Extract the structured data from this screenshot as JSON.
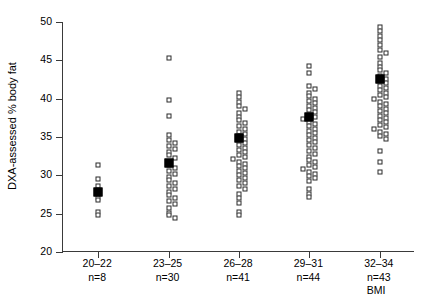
{
  "chart_data": {
    "type": "scatter",
    "title": "",
    "xlabel": "BMI",
    "ylabel": "DXA-assessed % body fat",
    "ylim": [
      20,
      50
    ],
    "yticks": [
      20,
      25,
      30,
      35,
      40,
      45,
      50
    ],
    "grid": false,
    "legend": null,
    "categories": [
      "20–22",
      "23–25",
      "26–28",
      "29–31",
      "32–34"
    ],
    "counts": [
      "n=8",
      "n=30",
      "n=41",
      "n=44",
      "n=43"
    ],
    "n_values": [
      8,
      30,
      41,
      44,
      43
    ],
    "means": [
      27.8,
      31.6,
      34.9,
      37.6,
      42.6
    ],
    "groups": [
      {
        "category": "20–22",
        "count_label": "n=8",
        "mean": 27.8,
        "values": [
          31.4,
          29.5,
          28.6,
          27.9,
          27.1,
          26.8,
          25.2,
          24.8
        ]
      },
      {
        "category": "23–25",
        "count_label": "n=30",
        "mean": 31.6,
        "values": [
          45.3,
          39.8,
          37.8,
          35.2,
          34.6,
          34.2,
          33.8,
          33.4,
          33.0,
          32.6,
          32.2,
          31.8,
          31.4,
          31.0,
          30.6,
          30.2,
          29.8,
          29.4,
          29.0,
          28.6,
          28.2,
          27.8,
          27.4,
          27.0,
          26.6,
          26.2,
          25.8,
          25.1,
          24.8,
          24.4
        ]
      },
      {
        "category": "26–28",
        "mean": 34.9,
        "count_label": "n=41",
        "values": [
          40.8,
          40.2,
          39.6,
          39.1,
          38.6,
          38.1,
          37.6,
          37.2,
          36.8,
          36.4,
          36.0,
          35.7,
          35.4,
          35.1,
          34.8,
          34.5,
          34.2,
          33.9,
          33.6,
          33.3,
          33.0,
          32.7,
          32.4,
          32.1,
          31.8,
          31.5,
          31.2,
          30.9,
          30.6,
          30.3,
          30.0,
          29.7,
          29.4,
          29.0,
          28.6,
          28.2,
          27.6,
          27.0,
          26.4,
          25.2,
          24.8
        ]
      },
      {
        "category": "29–31",
        "mean": 37.6,
        "count_label": "n=44",
        "values": [
          44.2,
          43.3,
          41.6,
          41.2,
          40.8,
          40.4,
          40.0,
          39.7,
          39.4,
          39.1,
          38.8,
          38.5,
          38.2,
          37.9,
          37.6,
          37.3,
          37.0,
          36.7,
          36.4,
          36.1,
          35.8,
          35.5,
          35.2,
          34.9,
          34.6,
          34.3,
          34.0,
          33.6,
          33.2,
          32.8,
          32.4,
          32.0,
          31.7,
          31.4,
          31.1,
          30.8,
          30.5,
          30.2,
          29.9,
          29.6,
          29.3,
          28.2,
          27.6,
          27.2
        ]
      },
      {
        "category": "32–34",
        "mean": 42.6,
        "count_label": "n=43",
        "values": [
          49.4,
          48.8,
          48.2,
          47.6,
          47.0,
          46.4,
          45.9,
          45.4,
          44.6,
          44.1,
          43.7,
          43.3,
          42.9,
          42.6,
          42.3,
          42.0,
          41.7,
          41.4,
          41.1,
          40.8,
          40.5,
          40.2,
          39.9,
          39.6,
          39.3,
          39.0,
          38.7,
          38.4,
          38.1,
          37.8,
          37.5,
          37.2,
          36.9,
          36.6,
          36.3,
          36.0,
          35.7,
          35.4,
          35.1,
          34.8,
          33.2,
          31.8,
          30.4
        ]
      }
    ]
  },
  "axis": {
    "x_title": "BMI"
  }
}
